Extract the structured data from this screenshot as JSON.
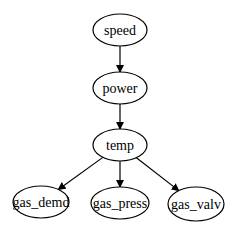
{
  "diagram": {
    "type": "directed-graph",
    "nodes": [
      {
        "id": "speed",
        "label": "speed",
        "cx": 120,
        "cy": 30,
        "rx": 27,
        "ry": 16
      },
      {
        "id": "power",
        "label": "power",
        "cx": 120,
        "cy": 88,
        "rx": 27,
        "ry": 16
      },
      {
        "id": "temp",
        "label": "temp",
        "cx": 120,
        "cy": 145,
        "rx": 27,
        "ry": 16
      },
      {
        "id": "gas_demd",
        "label": "gas_demd",
        "cx": 41,
        "cy": 202,
        "rx": 28,
        "ry": 16
      },
      {
        "id": "gas_press",
        "label": "gas_press",
        "cx": 120,
        "cy": 203,
        "rx": 29,
        "ry": 16
      },
      {
        "id": "gas_valv",
        "label": "gas_valv",
        "cx": 196,
        "cy": 204,
        "rx": 28,
        "ry": 17
      }
    ],
    "edges": [
      {
        "from": "speed",
        "to": "power"
      },
      {
        "from": "power",
        "to": "temp"
      },
      {
        "from": "temp",
        "to": "gas_demd"
      },
      {
        "from": "temp",
        "to": "gas_press"
      },
      {
        "from": "temp",
        "to": "gas_valv"
      }
    ]
  }
}
